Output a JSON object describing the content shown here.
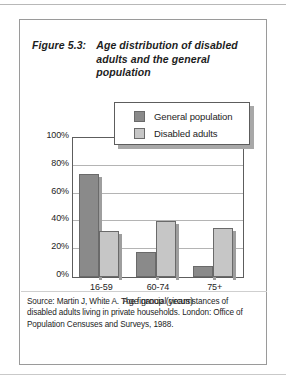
{
  "figure": {
    "number_label": "Figure 5.3:",
    "caption": "Age distribution of disabled adults and the general population",
    "source_note": "Source: Martin J, White A. The financial circumstances of disabled adults living in private households. London: Office of Population Censuses and Surveys, 1988."
  },
  "chart_data": {
    "type": "bar",
    "title": "Age distribution of disabled adults and the general population",
    "categories": [
      "16-59",
      "60-74",
      "75+"
    ],
    "series": [
      {
        "name": "General population",
        "values": [
          74,
          18,
          8
        ],
        "color": "#8a8a8a"
      },
      {
        "name": "Disabled adults",
        "values": [
          33,
          40,
          35
        ],
        "color": "#c6c6c6"
      }
    ],
    "xlabel": "Age group (years)",
    "ylabel": "",
    "ylim": [
      0,
      100
    ],
    "ytick_labels": [
      "0%",
      "20%",
      "40%",
      "60%",
      "80%",
      "100%"
    ],
    "ytick_values": [
      0,
      20,
      40,
      60,
      80,
      100
    ],
    "grid": true,
    "legend_position": "top-center",
    "value_suffix": "%"
  }
}
